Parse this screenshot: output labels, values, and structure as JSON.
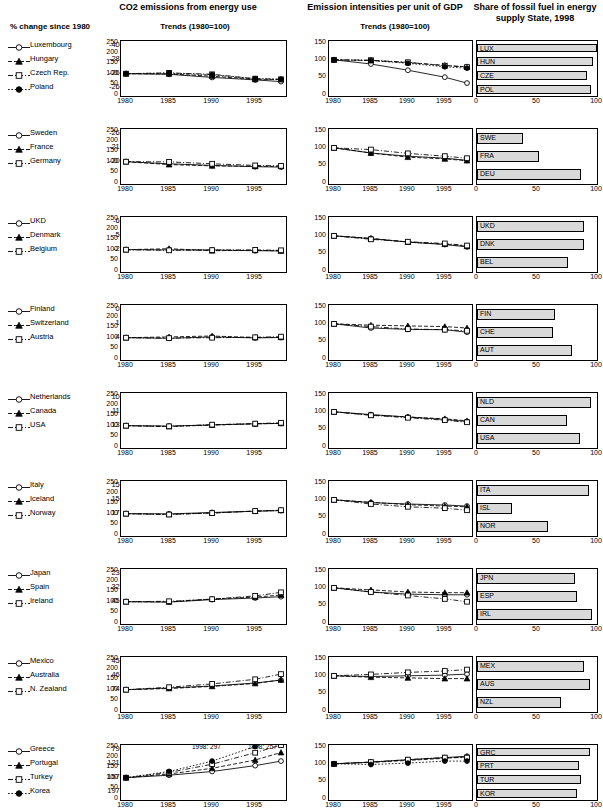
{
  "header": {
    "col1_title": "CO2 emissions from energy use",
    "col2_title": "Emission intensities per unit of GDP",
    "col3_title": "Share of fossil fuel in energy supply State, 1998",
    "sub1": "Trends (1980=100)",
    "sub2": "Trends (1980=100)",
    "pct_label": "% change since 1980"
  },
  "axes": {
    "trend_yticks": [
      "0",
      "50",
      "100",
      "150",
      "200",
      "250"
    ],
    "trend_yticks_tall": [
      "0",
      "50",
      "100",
      "150"
    ],
    "xticks": [
      "1980",
      "1985",
      "1990",
      "1995"
    ],
    "bar_xticks": [
      "0",
      "50",
      "100"
    ],
    "trend_ylim": [
      0,
      250
    ],
    "intensity_ylim": [
      0,
      150
    ],
    "bar_xlim": [
      0,
      100
    ],
    "xlim": [
      1980,
      1998
    ]
  },
  "annotations": {
    "g1": "1998: 297",
    "g2": "1998: 257"
  },
  "chart_data": {
    "type": "line",
    "xlabel": "",
    "ylabel": "Index (1980=100)",
    "groups": [
      {
        "id": 1,
        "countries": [
          {
            "name": "Luxembourg",
            "code": "LUX",
            "change": "-40.2",
            "marker": "circle-open",
            "line": "solid",
            "emissions": [
              100,
              97,
              82,
              70,
              62
            ],
            "intensity": [
              100,
              88,
              70,
              50,
              33
            ],
            "fossil": 100
          },
          {
            "name": "Hungary",
            "code": "HUN",
            "change": "-28.8",
            "marker": "triangle-filled",
            "line": "dashed",
            "emissions": [
              100,
              99,
              88,
              73,
              72
            ],
            "intensity": [
              100,
              98,
              92,
              84,
              80
            ],
            "fossil": 97
          },
          {
            "name": "Czech Rep.",
            "code": "CZE",
            "change": "-26.9",
            "marker": "square-open",
            "line": "dashdot",
            "emissions": [
              100,
              104,
              97,
              76,
              73
            ],
            "intensity": [
              100,
              99,
              93,
              83,
              79
            ],
            "fossil": 92
          },
          {
            "name": "Poland",
            "code": "POL",
            "change": "-26.8",
            "marker": "circle-filled",
            "line": "dotted",
            "emissions": [
              100,
              103,
              95,
              76,
              73
            ],
            "intensity": [
              100,
              98,
              90,
              80,
              76
            ],
            "fossil": 95
          }
        ]
      },
      {
        "id": 2,
        "countries": [
          {
            "name": "Sweden",
            "code": "SWE",
            "change": "-26.2",
            "marker": "circle-open",
            "line": "solid",
            "emissions": [
              100,
              90,
              82,
              76,
              74
            ],
            "intensity": [
              100,
              85,
              76,
              70,
              64
            ],
            "fossil": 38
          },
          {
            "name": "France",
            "code": "FRA",
            "change": "-21.6",
            "marker": "triangle-filled",
            "line": "dashed",
            "emissions": [
              100,
              86,
              80,
              78,
              78
            ],
            "intensity": [
              100,
              85,
              73,
              68,
              63
            ],
            "fossil": 52
          },
          {
            "name": "Germany",
            "code": "DEU",
            "change": "-20.2",
            "marker": "square-open",
            "line": "dashdot",
            "emissions": [
              100,
              99,
              90,
              82,
              80
            ],
            "intensity": [
              100,
              95,
              84,
              76,
              70
            ],
            "fossil": 87
          }
        ]
      },
      {
        "id": 3,
        "countries": [
          {
            "name": "UKD",
            "code": "UKD",
            "change": "-6.0",
            "marker": "circle-open",
            "line": "solid",
            "emissions": [
              100,
              99,
              99,
              95,
              94
            ],
            "intensity": [
              100,
              92,
              82,
              75,
              68
            ],
            "fossil": 89
          },
          {
            "name": "Denmark",
            "code": "DNK",
            "change": "-5.9",
            "marker": "triangle-filled",
            "line": "dashed",
            "emissions": [
              100,
              105,
              95,
              97,
              94
            ],
            "intensity": [
              100,
              93,
              82,
              76,
              70
            ],
            "fossil": 89
          },
          {
            "name": "Belgium",
            "code": "BEL",
            "change": "-2.6",
            "marker": "square-open",
            "line": "dashdot",
            "emissions": [
              100,
              97,
              98,
              99,
              97
            ],
            "intensity": [
              100,
              90,
              83,
              78,
              72
            ],
            "fossil": 76
          }
        ]
      },
      {
        "id": 4,
        "countries": [
          {
            "name": "Finland",
            "code": "FIN",
            "change": "0.7",
            "marker": "circle-open",
            "line": "solid",
            "emissions": [
              100,
              97,
              104,
              99,
              101
            ],
            "intensity": [
              100,
              88,
              84,
              83,
              76
            ],
            "fossil": 65
          },
          {
            "name": "Switzerland",
            "code": "CHE",
            "change": "1.8",
            "marker": "triangle-filled",
            "line": "dashed",
            "emissions": [
              100,
              104,
              108,
              101,
              102
            ],
            "intensity": [
              100,
              96,
              94,
              92,
              88
            ],
            "fossil": 63
          },
          {
            "name": "Austria",
            "code": "AUT",
            "change": "4.5",
            "marker": "square-open",
            "line": "dashdot",
            "emissions": [
              100,
              98,
              100,
              102,
              105
            ],
            "intensity": [
              100,
              92,
              85,
              83,
              80
            ],
            "fossil": 79
          }
        ]
      },
      {
        "id": 5,
        "countries": [
          {
            "name": "Netherlands",
            "code": "NLD",
            "change": "10.9",
            "marker": "circle-open",
            "line": "solid",
            "emissions": [
              100,
              98,
              104,
              109,
              111
            ],
            "intensity": [
              100,
              92,
              85,
              78,
              72
            ],
            "fossil": 95
          },
          {
            "name": "Canada",
            "code": "CAN",
            "change": "11.3",
            "marker": "triangle-filled",
            "line": "dashed",
            "emissions": [
              100,
              96,
              103,
              109,
              111
            ],
            "intensity": [
              100,
              91,
              85,
              80,
              74
            ],
            "fossil": 75
          },
          {
            "name": "USA",
            "code": "USA",
            "change": "13.5",
            "marker": "square-open",
            "line": "dashdot",
            "emissions": [
              100,
              97,
              105,
              110,
              114
            ],
            "intensity": [
              100,
              90,
              83,
              76,
              70
            ],
            "fossil": 86
          }
        ]
      },
      {
        "id": 6,
        "countries": [
          {
            "name": "Italy",
            "code": "ITA",
            "change": "15.1",
            "marker": "circle-open",
            "line": "solid",
            "emissions": [
              100,
              99,
              106,
              112,
              115
            ],
            "intensity": [
              100,
              92,
              88,
              85,
              82
            ],
            "fossil": 93
          },
          {
            "name": "Iceland",
            "code": "ISL",
            "change": "15.9",
            "marker": "triangle-filled",
            "line": "dashed",
            "emissions": [
              100,
              97,
              104,
              112,
              116
            ],
            "intensity": [
              100,
              93,
              86,
              82,
              80
            ],
            "fossil": 29
          },
          {
            "name": "Norway",
            "code": "NOR",
            "change": "17.4",
            "marker": "square-open",
            "line": "dashdot",
            "emissions": [
              100,
              96,
              103,
              113,
              117
            ],
            "intensity": [
              100,
              88,
              80,
              76,
              70
            ],
            "fossil": 59
          }
        ]
      },
      {
        "id": 7,
        "countries": [
          {
            "name": "Japan",
            "code": "JPN",
            "change": "23.6",
            "marker": "circle-open",
            "line": "solid",
            "emissions": [
              100,
              98,
              110,
              118,
              124
            ],
            "intensity": [
              100,
              88,
              82,
              80,
              80
            ],
            "fossil": 82
          },
          {
            "name": "Spain",
            "code": "ESP",
            "change": "32.4",
            "marker": "triangle-filled",
            "line": "dashed",
            "emissions": [
              100,
              99,
              113,
              122,
              132
            ],
            "intensity": [
              100,
              94,
              88,
              86,
              86
            ],
            "fossil": 83
          },
          {
            "name": "Ireland",
            "code": "IRL",
            "change": "45.3",
            "marker": "square-open",
            "line": "dashdot",
            "emissions": [
              100,
              102,
              112,
              128,
              145
            ],
            "intensity": [
              100,
              88,
              78,
              68,
              60
            ],
            "fossil": 96
          }
        ]
      },
      {
        "id": 8,
        "countries": [
          {
            "name": "Mexico",
            "code": "MEX",
            "change": "45.9",
            "marker": "circle-open",
            "line": "solid",
            "emissions": [
              100,
              108,
              118,
              132,
              146
            ],
            "intensity": [
              100,
              98,
              100,
              102,
              105
            ],
            "fossil": 89
          },
          {
            "name": "Australia",
            "code": "AUS",
            "change": "46.6",
            "marker": "triangle-filled",
            "line": "dashed",
            "emissions": [
              100,
              106,
              116,
              130,
              147
            ],
            "intensity": [
              100,
              96,
              94,
              92,
              92
            ],
            "fossil": 94
          },
          {
            "name": "N. Zealand",
            "code": "NZL",
            "change": "74.5",
            "marker": "square-open",
            "line": "dashdot",
            "emissions": [
              100,
              112,
              128,
              150,
              175
            ],
            "intensity": [
              100,
              104,
              110,
              114,
              118
            ],
            "fossil": 70
          }
        ]
      },
      {
        "id": 9,
        "countries": [
          {
            "name": "Greece",
            "code": "GRC",
            "change": "79.5",
            "marker": "circle-open",
            "line": "solid",
            "emissions": [
              100,
              112,
              130,
              158,
              180
            ],
            "intensity": [
              100,
              105,
              112,
              118,
              122
            ],
            "fossil": 94
          },
          {
            "name": "Portugal",
            "code": "PRT",
            "change": "121.0",
            "marker": "triangle-filled",
            "line": "dashed",
            "emissions": [
              100,
              118,
              145,
              185,
              221
            ],
            "intensity": [
              100,
              104,
              110,
              116,
              120
            ],
            "fossil": 85
          },
          {
            "name": "Turkey",
            "code": "TUR",
            "change": "157.1",
            "marker": "square-open",
            "line": "dashdot",
            "emissions": [
              100,
              125,
              165,
              220,
              257
            ],
            "intensity": [
              100,
              105,
              112,
              118,
              118
            ],
            "fossil": 87
          },
          {
            "name": "Korea",
            "code": "KOR",
            "change": "197.4",
            "marker": "circle-filled",
            "line": "dotted",
            "emissions": [
              100,
              130,
              180,
              250,
              297
            ],
            "intensity": [
              100,
              98,
              102,
              108,
              108
            ],
            "fossil": 83
          }
        ]
      }
    ]
  }
}
